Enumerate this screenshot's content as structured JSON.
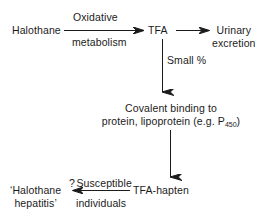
{
  "diagram": {
    "background_color": "#ffffff",
    "ink_color": "#1b1b1b",
    "type": "flow-diagram",
    "nodes": {
      "halothane": "Halothane",
      "tfa": "TFA",
      "urinary_line1": "Urinary",
      "urinary_line2": "excretion",
      "covalent_line1": "Covalent binding to",
      "covalent_line2_pre": "protein, lipoprotein (e.g. P",
      "covalent_line2_sub": "450",
      "covalent_line2_post": ")",
      "tfa_hapten": "TFA-hapten",
      "hepatitis_line1": "‘Halothane",
      "hepatitis_line2": "hepatitis’"
    },
    "edge_labels": {
      "oxidative": "Oxidative",
      "metabolism": "metabolism",
      "small_percent": "Small %",
      "susceptible_qmark": "?",
      "susceptible": "Susceptible",
      "individuals": "individuals"
    },
    "edges": [
      {
        "from": "halothane",
        "to": "tfa",
        "label": "Oxidative metabolism",
        "direction": "right"
      },
      {
        "from": "tfa",
        "to": "urinary excretion",
        "label": "",
        "direction": "right"
      },
      {
        "from": "tfa",
        "to": "covalent binding",
        "label": "Small %",
        "direction": "down"
      },
      {
        "from": "covalent binding",
        "to": "TFA-hapten",
        "label": "",
        "direction": "down"
      },
      {
        "from": "TFA-hapten",
        "to": "halothane hepatitis",
        "label": "?Susceptible individuals",
        "direction": "left"
      }
    ]
  }
}
